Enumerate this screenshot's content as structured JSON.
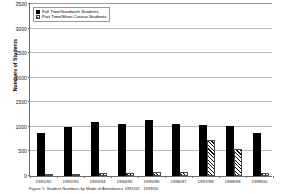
{
  "chart_data": {
    "type": "bar",
    "title": "",
    "xlabel": "",
    "ylabel": "Numbers of Students",
    "ylim": [
      0,
      3500
    ],
    "ytick_step": 500,
    "yticks": [
      "0",
      "500",
      "1000",
      "1500",
      "2000",
      "2500",
      "3000",
      "3500"
    ],
    "grid": true,
    "legend_position": "top-left",
    "categories": [
      "1991/92",
      "1992/93",
      "1993/94",
      "1994/95",
      "1995/96",
      "1996/97",
      "1997/98",
      "1998/99",
      "1999/00"
    ],
    "series": [
      {
        "name": "Full Time/Sandwich Students",
        "fill": "solid-black",
        "values": [
          880,
          1000,
          1090,
          1060,
          1130,
          1060,
          1040,
          1010,
          870
        ]
      },
      {
        "name": "Part Time/Short Course Students",
        "fill": "diagonal-hatch",
        "values": [
          30,
          25,
          60,
          70,
          90,
          80,
          740,
          540,
          70
        ]
      }
    ]
  },
  "legend": {
    "items": [
      {
        "label": "Full Time/Sandwich Students"
      },
      {
        "label": "Part Time/Short Course Students"
      }
    ]
  },
  "caption": {
    "text": "Figure 1: Student Numbers by Mode of Attendance 1991/92 - 1999/00"
  },
  "colors": {
    "full_time_bar": "#000000",
    "part_time_bar": "#ffffff",
    "gridline": "#b8b8b8",
    "axis": "#6d6d6d",
    "text": "#1a1a1a"
  }
}
